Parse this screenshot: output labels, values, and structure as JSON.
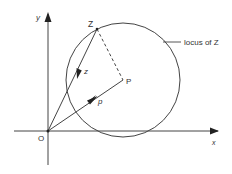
{
  "diagram": {
    "type": "geometry-argand",
    "axes": {
      "x_label": "x",
      "y_label": "y",
      "origin_label": "O"
    },
    "points": {
      "Z": {
        "label": "Z"
      },
      "P": {
        "label": "P"
      }
    },
    "vectors": {
      "z": {
        "label": "z",
        "from": "O",
        "to": "Z"
      },
      "p": {
        "label": "p",
        "from": "O",
        "to": "P"
      }
    },
    "segments": [
      {
        "from": "Z",
        "to": "P",
        "style": "dashed"
      }
    ],
    "circle": {
      "center": "P",
      "through": "Z",
      "annotation": "locus of Z"
    },
    "colors": {
      "line": "#333333",
      "background": "#ffffff"
    }
  }
}
